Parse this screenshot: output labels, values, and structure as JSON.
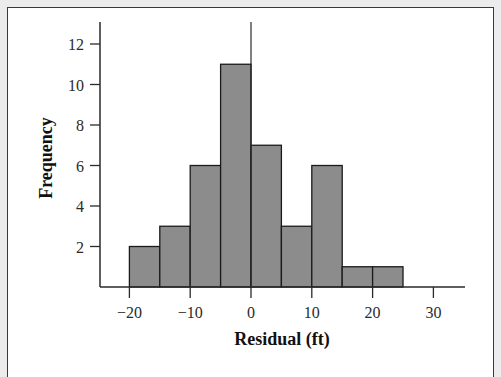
{
  "chart_data": {
    "type": "bar",
    "subtype": "histogram",
    "title": "",
    "xlabel": "Residual (ft)",
    "ylabel": "Frequency",
    "bins": [
      {
        "start": -20,
        "end": -15,
        "count": 2
      },
      {
        "start": -15,
        "end": -10,
        "count": 3
      },
      {
        "start": -10,
        "end": -5,
        "count": 6
      },
      {
        "start": -5,
        "end": 0,
        "count": 11
      },
      {
        "start": 0,
        "end": 5,
        "count": 7
      },
      {
        "start": 5,
        "end": 10,
        "count": 3
      },
      {
        "start": 10,
        "end": 15,
        "count": 6
      },
      {
        "start": 15,
        "end": 20,
        "count": 1
      },
      {
        "start": 20,
        "end": 25,
        "count": 1
      }
    ],
    "categories": [
      "-20 to -15",
      "-15 to -10",
      "-10 to -5",
      "-5 to 0",
      "0 to 5",
      "5 to 10",
      "10 to 15",
      "15 to 20",
      "20 to 25"
    ],
    "values": [
      2,
      3,
      6,
      11,
      7,
      3,
      6,
      1,
      1
    ],
    "x_ticks": [
      "−20",
      "−10",
      "0",
      "10",
      "20",
      "30"
    ],
    "x_tick_values": [
      -20,
      -10,
      0,
      10,
      20,
      30
    ],
    "y_ticks": [
      "2",
      "4",
      "6",
      "8",
      "10",
      "12"
    ],
    "y_tick_values": [
      2,
      4,
      6,
      8,
      10,
      12
    ],
    "xlim": [
      -25,
      35
    ],
    "ylim": [
      0,
      13
    ],
    "grid": false,
    "legend": null,
    "colors": {
      "bar_fill": "#8c8c8c",
      "bar_edge": "#1a1a1a",
      "axis": "#2a2a2a",
      "background": "#ffffff",
      "outer": "#ececec"
    }
  }
}
